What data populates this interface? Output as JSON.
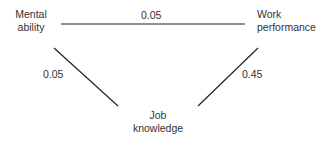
{
  "nodes": {
    "mental_ability": {
      "line1": "Mental",
      "line2": "ability"
    },
    "work_performance": {
      "line1": "Work",
      "line2": "performance"
    },
    "job_knowledge": {
      "line1": "Job",
      "line2": "knowledge"
    }
  },
  "edges": {
    "mental_work": "0.05",
    "mental_job": "0.05",
    "job_work": "0.45"
  },
  "colors": {
    "line": "#222222",
    "text": "#333333"
  }
}
